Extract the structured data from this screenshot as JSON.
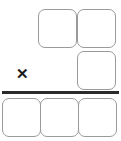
{
  "worksheet": {
    "kind": "multiplication-work-area",
    "width": 121,
    "height": 141,
    "background_color": "#ffffff",
    "operator": {
      "name": "multiplication-operator",
      "symbol": "✕",
      "label": "times",
      "color": "#1a1a1a",
      "x": 15,
      "y": 65,
      "width": 15,
      "height": 16,
      "font_size": 15
    },
    "rule": {
      "name": "horizontal-rule",
      "color": "#2b2b2b",
      "x": 2,
      "y": 91,
      "width": 117,
      "height": 3
    },
    "box_style": {
      "border_color": "#9a9a9a",
      "fill_color": "#ffffff",
      "border_width": 1,
      "corner_radius": 7
    },
    "rows": [
      {
        "name": "multiplicand-row",
        "position": "above-rule",
        "boxes": [
          {
            "name": "box-multiplicand-1",
            "value": "",
            "x": 38,
            "y": 9,
            "width": 39,
            "height": 39
          },
          {
            "name": "box-multiplicand-2",
            "value": "",
            "x": 77,
            "y": 9,
            "width": 39,
            "height": 39
          }
        ]
      },
      {
        "name": "multiplier-row",
        "position": "above-rule",
        "boxes": [
          {
            "name": "box-multiplier-1",
            "value": "",
            "x": 77,
            "y": 51,
            "width": 39,
            "height": 39
          }
        ]
      },
      {
        "name": "product-row",
        "position": "below-rule",
        "boxes": [
          {
            "name": "box-product-1",
            "value": "",
            "x": 2,
            "y": 98,
            "width": 39,
            "height": 39
          },
          {
            "name": "box-product-2",
            "value": "",
            "x": 40,
            "y": 98,
            "width": 39,
            "height": 39
          },
          {
            "name": "box-product-3",
            "value": "",
            "x": 78,
            "y": 98,
            "width": 39,
            "height": 39
          }
        ]
      }
    ]
  }
}
